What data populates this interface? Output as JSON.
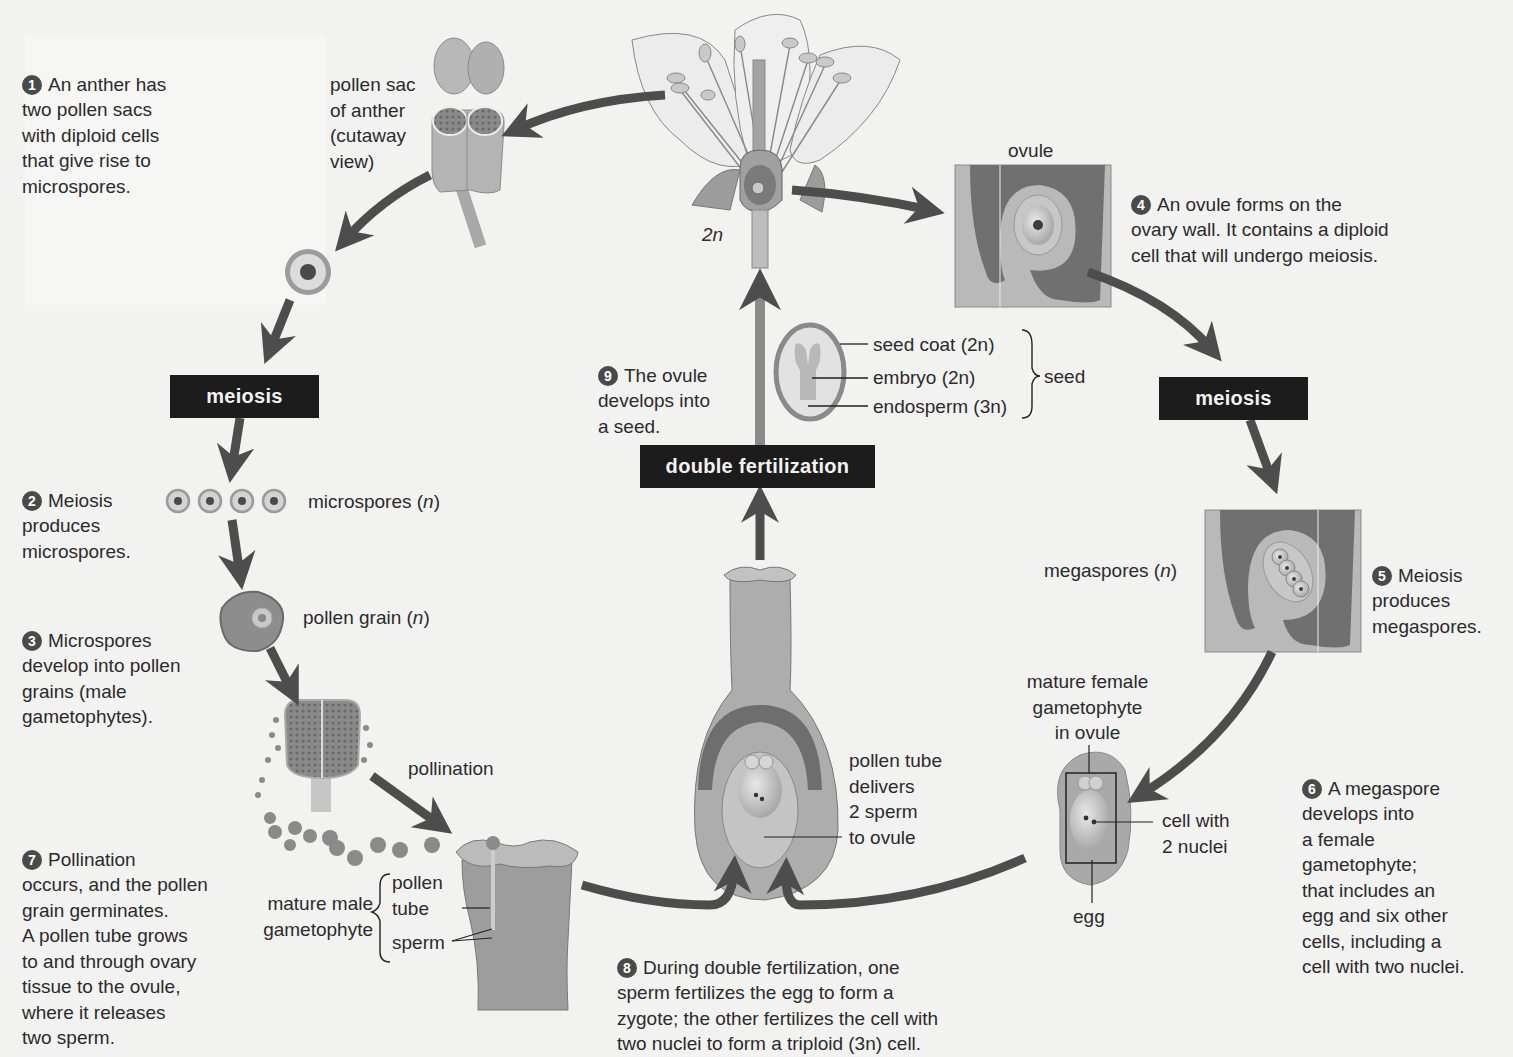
{
  "colors": {
    "background": "#f2f2f1",
    "arrow": "#4a4a4a",
    "label_box": "#1c1c1c",
    "tissue_dark": "#6e6e6e",
    "tissue_light": "#bdbdbd",
    "tissue_pale": "#d6d6d6"
  },
  "steps": [
    {
      "num": "1",
      "text": "An anther has\ntwo pollen sacs\nwith diploid cells\nthat give rise to\nmicrospores."
    },
    {
      "num": "2",
      "text": "Meiosis\nproduces\nmicrospores."
    },
    {
      "num": "3",
      "text": "Microspores\ndevelop into pollen\ngrains (male\ngametophytes)."
    },
    {
      "num": "4",
      "text": "An ovule forms on the\novary wall. It contains a diploid\ncell that will undergo meiosis."
    },
    {
      "num": "5",
      "text": "Meiosis\nproduces\nmegaspores."
    },
    {
      "num": "6",
      "text": "A megaspore\ndevelops into\na female\ngametophyte;\nthat includes an\negg and six other\ncells, including a\ncell with two nuclei."
    },
    {
      "num": "7",
      "text": "Pollination\noccurs, and the pollen\ngrain germinates.\nA pollen tube grows\nto and through ovary\ntissue to the ovule,\nwhere it releases\ntwo sperm."
    },
    {
      "num": "8",
      "text": "During double fertilization, one\nsperm fertilizes the egg to form a\nzygote; the other fertilizes the cell with\ntwo nuclei to form a triploid (3n) cell."
    },
    {
      "num": "9",
      "text": "The ovule\ndevelops into\na seed."
    }
  ],
  "process_boxes": {
    "meiosis_left": "meiosis",
    "meiosis_right": "meiosis",
    "double_fertilization": "double fertilization"
  },
  "labels": {
    "pollen_sac": "pollen sac\nof anther\n(cutaway\nview)",
    "flower_ploidy": "2n",
    "ovule": "ovule",
    "microspores": "microspores (n)",
    "pollen_grain": "pollen grain (n)",
    "pollination": "pollination",
    "mature_male_gametophyte": "mature male\ngametophyte",
    "pollen_tube": "pollen\ntube",
    "sperm": "sperm",
    "seed_coat": "seed coat (2n)",
    "embryo": "embryo (2n)",
    "endosperm": "endosperm (3n)",
    "seed": "seed",
    "megaspores": "megaspores (n)",
    "mature_female_gametophyte": "mature female\ngametophyte\nin ovule",
    "cell_with_2_nuclei": "cell with\n2 nuclei",
    "egg": "egg",
    "pollen_tube_delivers": "pollen tube\ndelivers\n2 sperm\nto ovule"
  }
}
